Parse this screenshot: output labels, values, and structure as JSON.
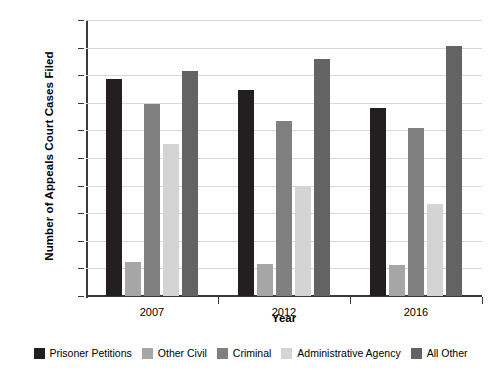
{
  "chart_data": {
    "type": "bar",
    "title": "",
    "xlabel": "Year",
    "ylabel": "Number of Appeals Court Cases Filed",
    "categories": [
      "2007",
      "2012",
      "2016"
    ],
    "ylim": [
      0,
      20000
    ],
    "yticks": [
      0,
      2000,
      4000,
      6000,
      8000,
      10000,
      12000,
      14000,
      16000,
      18000,
      20000
    ],
    "ytick_labels": [
      "0",
      "2000",
      "4000",
      "6000",
      "8000",
      "10,000",
      "12,000",
      "14,000",
      "16,000",
      "18,000",
      "20,000"
    ],
    "grid": true,
    "legend_position": "bottom",
    "series": [
      {
        "name": "Prisoner Petitions",
        "color": "#231f20",
        "values": [
          15750,
          14950,
          13600
        ]
      },
      {
        "name": "Other Civil",
        "color": "#a6a6a6",
        "values": [
          2450,
          2300,
          2250
        ]
      },
      {
        "name": "Criminal",
        "color": "#808080",
        "values": [
          13900,
          12700,
          12200
        ]
      },
      {
        "name": "Administrative Agency",
        "color": "#d4d4d4",
        "values": [
          11000,
          7900,
          6700
        ]
      },
      {
        "name": "All Other",
        "color": "#636363",
        "values": [
          16300,
          17200,
          18100
        ]
      }
    ]
  }
}
